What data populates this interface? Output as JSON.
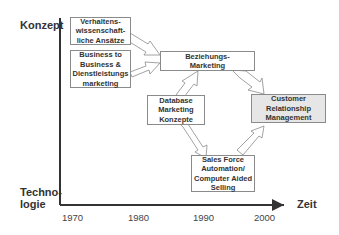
{
  "axes": {
    "y_top_label": "Konzept",
    "y_bottom_label": "Techno-\nlogie",
    "x_label": "Zeit",
    "x_ticks": [
      "1970",
      "1980",
      "1990",
      "2000"
    ]
  },
  "boxes": [
    {
      "id": "verhaltens",
      "text": "Verhaltens-\nwissenschaft-\nliche Ansätze",
      "highlight": false
    },
    {
      "id": "b2b",
      "text": "Business to\nBusiness &\nDienstleistungs\nmarketing",
      "highlight": false
    },
    {
      "id": "beziehung",
      "text": "Beziehungs-\nMarketing",
      "highlight": false
    },
    {
      "id": "database",
      "text": "Database\nMarketing\nKonzepte",
      "highlight": false
    },
    {
      "id": "crm",
      "text": "Customer\nRelationship\nManagement",
      "highlight": true
    },
    {
      "id": "sfa",
      "text": "Sales Force\nAutomation/\nComputer Aided\nSelling",
      "highlight": false
    }
  ],
  "arrows": [
    {
      "from": "verhaltens",
      "to": "beziehung"
    },
    {
      "from": "b2b",
      "to": "beziehung"
    },
    {
      "from": "database",
      "to": "beziehung"
    },
    {
      "from": "beziehung",
      "to": "crm"
    },
    {
      "from": "database",
      "to": "sfa"
    },
    {
      "from": "sfa",
      "to": "crm"
    }
  ],
  "colors": {
    "axis": "#333333",
    "box_border": "#8a8a8a",
    "highlight_fill": "#e6e6e6",
    "arrow_stroke": "#8a8a8a"
  }
}
